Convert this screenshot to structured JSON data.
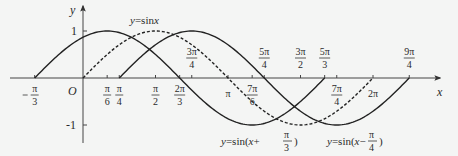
{
  "chart_data": {
    "type": "line",
    "title": "",
    "xlabel": "x",
    "ylabel": "y",
    "origin_label": "O",
    "ylim": [
      -1,
      1
    ],
    "xlim_radians": [
      -0.36,
      2.4
    ],
    "y_ticks": [
      {
        "value": 1,
        "label": "1"
      },
      {
        "value": -1,
        "label": "-1"
      }
    ],
    "x_ticks": [
      {
        "value": "-π/3",
        "num": "π",
        "den": "3",
        "neg": true,
        "pos_pi": -0.3333,
        "side": "below"
      },
      {
        "value": "π/6",
        "num": "π",
        "den": "6",
        "pos_pi": 0.1667,
        "side": "below"
      },
      {
        "value": "π/4",
        "num": "π",
        "den": "4",
        "pos_pi": 0.25,
        "side": "below"
      },
      {
        "value": "π/2",
        "num": "π",
        "den": "2",
        "pos_pi": 0.5,
        "side": "below"
      },
      {
        "value": "2π/3",
        "num": "2π",
        "den": "3",
        "pos_pi": 0.6667,
        "side": "below"
      },
      {
        "value": "3π/4",
        "num": "3π",
        "den": "4",
        "pos_pi": 0.75,
        "side": "above"
      },
      {
        "value": "π",
        "num": "π",
        "den": "",
        "pos_pi": 1.0,
        "side": "below"
      },
      {
        "value": "7π/6",
        "num": "7π",
        "den": "6",
        "pos_pi": 1.1667,
        "side": "below"
      },
      {
        "value": "5π/4",
        "num": "5π",
        "den": "4",
        "pos_pi": 1.25,
        "side": "above"
      },
      {
        "value": "3π/2",
        "num": "3π",
        "den": "2",
        "pos_pi": 1.5,
        "side": "above"
      },
      {
        "value": "5π/3",
        "num": "5π",
        "den": "3",
        "pos_pi": 1.6667,
        "side": "above"
      },
      {
        "value": "7π/4",
        "num": "7π",
        "den": "4",
        "pos_pi": 1.75,
        "side": "below"
      },
      {
        "value": "2π",
        "num": "2π",
        "den": "",
        "pos_pi": 2.0,
        "side": "below"
      },
      {
        "value": "9π/4",
        "num": "9π",
        "den": "4",
        "pos_pi": 2.25,
        "side": "above"
      }
    ],
    "series": [
      {
        "name": "y=sinx",
        "expr": "sin(x)",
        "phase_pi": 0,
        "style": "dashed",
        "domain_pi": [
          0,
          2
        ]
      },
      {
        "name": "y=sin(x+π/3)",
        "expr": "sin(x+π/3)",
        "phase_pi": 0.3333,
        "style": "solid",
        "domain_pi": [
          -0.3333,
          1.6667
        ]
      },
      {
        "name": "y=sin(x−π/4)",
        "expr": "sin(x−π/4)",
        "phase_pi": -0.25,
        "style": "solid",
        "domain_pi": [
          0.25,
          2.25
        ]
      }
    ],
    "annotations": [
      {
        "text": "y=sinx",
        "near": "dashed curve top"
      },
      {
        "text": "y=sin(x+π/3)",
        "near": "bottom center"
      },
      {
        "text": "y=sin(x−π/4)",
        "near": "bottom right"
      }
    ],
    "grid": false,
    "legend": "none"
  },
  "labels": {
    "x_axis": "x",
    "y_axis": "y",
    "origin": "O",
    "y_one": "1",
    "y_neg_one": "-1",
    "curve_sin": {
      "pre": "y",
      "eq": "=sin",
      "var": "x"
    },
    "curve_plus": {
      "pre": "y",
      "eq": "=sin(",
      "var": "x",
      "op": "+ ",
      "num": "π",
      "den": "3",
      "post": ")"
    },
    "curve_minus": {
      "pre": "y",
      "eq": "=sin(",
      "var": "x",
      "op": "− ",
      "num": "π",
      "den": "4",
      "post": ")"
    }
  }
}
